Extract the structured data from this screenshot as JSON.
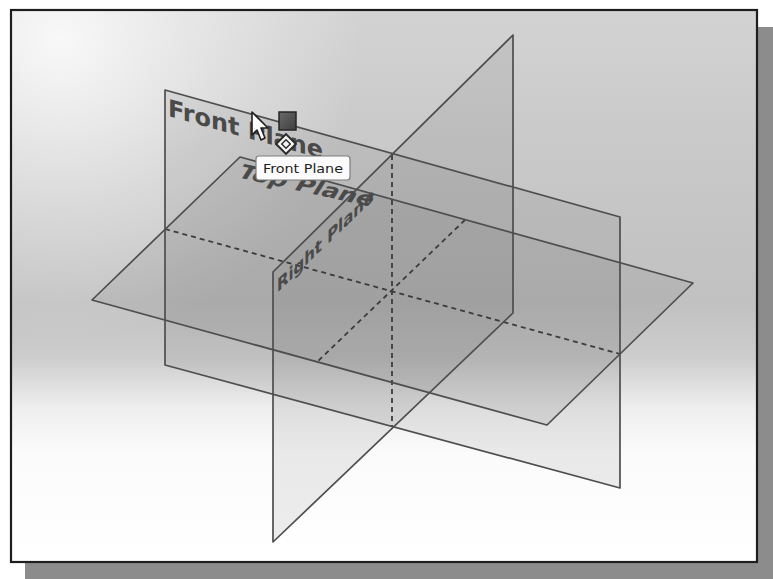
{
  "viewport": {
    "type": "3D graphics area",
    "colors": {
      "background_gray": "#c4c4c4",
      "background_light": "#ffffff",
      "frame_border": "#1e1e1e",
      "frame_shadow": "#8c8c8c",
      "plane_edge": "#4e4e4e",
      "plane_label": "#4a4a4a"
    }
  },
  "planes": {
    "front": {
      "label": "Front Plane"
    },
    "top": {
      "label": "Top Plane"
    },
    "right": {
      "label": "Right Plane"
    }
  },
  "tooltip": {
    "text": "Front Plane"
  },
  "cursor": {
    "pointer_icon": "arrow-pointer-icon",
    "selection_filter_icon": "face-selection-square-icon",
    "plane_symbol_icon": "plane-diamond-icon"
  }
}
